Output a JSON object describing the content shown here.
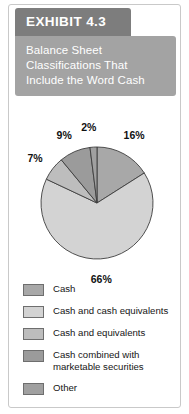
{
  "exhibit": {
    "tab_label": "EXHIBIT 4.3",
    "subtitle": "Balance Sheet\nClassifications That\nInclude the Word Cash"
  },
  "colors": {
    "tab_background": "#7d7d7d",
    "subtitle_background": "#a3a3a3",
    "card_border": "#c9c9c9",
    "slice_cash": "#a8a8a8",
    "slice_cash_and_cash_equivalents": "#d3d3d3",
    "slice_cash_and_equivalents": "#bdbdbd",
    "slice_cash_combined": "#9b9b9b",
    "slice_other": "#a0a0a0",
    "slice_outline": "#3d3d3d",
    "label_text": "#111111"
  },
  "chart_data": {
    "type": "pie",
    "title": "Balance Sheet Classifications That Include the Word Cash",
    "categories": [
      "Cash",
      "Cash and cash equivalents",
      "Cash and equivalents",
      "Cash combined with marketable securities",
      "Other"
    ],
    "values": [
      16,
      66,
      7,
      9,
      2
    ],
    "data_labels": [
      "16%",
      "66%",
      "7%",
      "9%",
      "2%"
    ],
    "unit": "percent",
    "start_angle_deg": 0,
    "direction": "clockwise",
    "legend_position": "bottom",
    "grid": false,
    "slice_colors": [
      "#a8a8a8",
      "#d3d3d3",
      "#bdbdbd",
      "#9b9b9b",
      "#a0a0a0"
    ]
  },
  "legend": {
    "items": [
      {
        "label": "Cash",
        "color": "#a8a8a8"
      },
      {
        "label": "Cash and cash equivalents",
        "color": "#d3d3d3"
      },
      {
        "label": "Cash and equivalents",
        "color": "#bdbdbd"
      },
      {
        "label": "Cash combined with\nmarketable securities",
        "color": "#9b9b9b"
      },
      {
        "label": "Other",
        "color": "#a0a0a0"
      }
    ]
  }
}
